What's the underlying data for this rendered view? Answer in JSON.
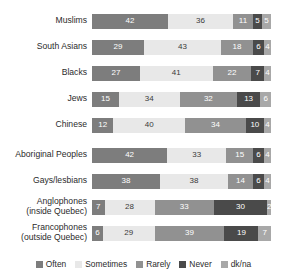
{
  "chart_data": {
    "type": "bar",
    "orientation": "horizontal",
    "stacked": true,
    "normalized_percent": true,
    "title": "",
    "subtitle": "",
    "xlabel": "",
    "ylabel": "",
    "xlim": [
      0,
      100
    ],
    "grid": false,
    "legend_position": "bottom",
    "categories": [
      "Muslims",
      "South Asians",
      "Blacks",
      "Jews",
      "Chinese",
      "Aboriginal Peoples",
      "Gays/lesbians",
      "Anglophones\n(inside Quebec)",
      "Francophones\n(outside Quebec)"
    ],
    "series": [
      {
        "name": "Often",
        "color": "#7d7d7d",
        "values": [
          42,
          29,
          27,
          15,
          12,
          42,
          38,
          7,
          6
        ]
      },
      {
        "name": "Sometimes",
        "color": "#e8e8e8",
        "values": [
          36,
          43,
          41,
          34,
          40,
          33,
          38,
          28,
          29
        ]
      },
      {
        "name": "Rarely",
        "color": "#919191",
        "values": [
          11,
          18,
          22,
          32,
          34,
          15,
          14,
          33,
          39
        ]
      },
      {
        "name": "Never",
        "color": "#4a4a4a",
        "values": [
          5,
          6,
          7,
          13,
          10,
          6,
          6,
          30,
          19
        ]
      },
      {
        "name": "dk/na",
        "color": "#a8a8a8",
        "values": [
          5,
          4,
          4,
          6,
          4,
          4,
          4,
          2,
          7
        ]
      }
    ],
    "group_break_after_index": 4
  },
  "legend": {
    "items": [
      {
        "label": "Often",
        "color": "#7d7d7d"
      },
      {
        "label": "Sometimes",
        "color": "#e8e8e8"
      },
      {
        "label": "Rarely",
        "color": "#919191"
      },
      {
        "label": "Never",
        "color": "#4a4a4a"
      },
      {
        "label": "dk/na",
        "color": "#a8a8a8"
      }
    ]
  }
}
